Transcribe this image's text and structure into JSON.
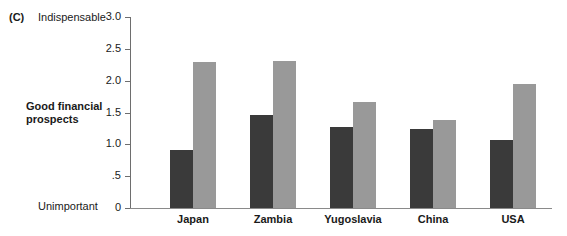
{
  "figure": {
    "panel_letter": "(C)",
    "axis_title": "Good financial prospects",
    "anchor_high": "Indispensable",
    "anchor_low": "Unimportant"
  },
  "colors": {
    "bar_dark": "#3a3a3a",
    "bar_light": "#999999",
    "axis": "#6e6e6e",
    "text": "#1a1a1a",
    "background": "#ffffff"
  },
  "chart_data": {
    "type": "bar",
    "title": "Good financial prospects",
    "xlabel": "",
    "ylabel": "Good financial prospects",
    "ylim": [
      0,
      3.0
    ],
    "yticks": [
      0,
      0.5,
      1.0,
      1.5,
      2.0,
      2.5,
      3.0
    ],
    "ytick_labels": [
      "0",
      ".5",
      "1.0",
      "1.5",
      "2.0",
      "2.5",
      "3.0"
    ],
    "y_axis_low_anchor": "Unimportant",
    "y_axis_high_anchor": "Indispensable",
    "grid": false,
    "legend": "none",
    "categories": [
      "Japan",
      "Zambia",
      "Yugoslavia",
      "China",
      "USA"
    ],
    "series": [
      {
        "name": "dark",
        "color": "#3a3a3a",
        "values": [
          0.91,
          1.46,
          1.27,
          1.24,
          1.07
        ]
      },
      {
        "name": "light",
        "color": "#999999",
        "values": [
          2.29,
          2.31,
          1.66,
          1.38,
          1.95
        ]
      }
    ]
  }
}
